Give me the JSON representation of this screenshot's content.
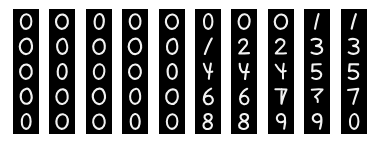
{
  "figure": {
    "name": "mnist-digit-sample-grid",
    "background_color": "#ffffff",
    "tile_background_color": "#000000",
    "digit_stroke_color": "#f2f2f2",
    "rows": 5,
    "columns": 10,
    "total_tiles": 50
  },
  "grid": {
    "rows": [
      {
        "row_index": 0,
        "cells": [
          {
            "label": "0"
          },
          {
            "label": "0"
          },
          {
            "label": "0"
          },
          {
            "label": "0"
          },
          {
            "label": "0"
          },
          {
            "label": "0"
          },
          {
            "label": "0"
          },
          {
            "label": "0"
          },
          {
            "label": "1"
          },
          {
            "label": "1"
          }
        ]
      },
      {
        "row_index": 1,
        "cells": [
          {
            "label": "0"
          },
          {
            "label": "0"
          },
          {
            "label": "0"
          },
          {
            "label": "0"
          },
          {
            "label": "0"
          },
          {
            "label": "1"
          },
          {
            "label": "2"
          },
          {
            "label": "2"
          },
          {
            "label": "3"
          },
          {
            "label": "3"
          }
        ]
      },
      {
        "row_index": 2,
        "cells": [
          {
            "label": "0"
          },
          {
            "label": "0"
          },
          {
            "label": "0"
          },
          {
            "label": "0"
          },
          {
            "label": "0"
          },
          {
            "label": "4"
          },
          {
            "label": "4"
          },
          {
            "label": "4"
          },
          {
            "label": "5"
          },
          {
            "label": "5"
          }
        ]
      },
      {
        "row_index": 3,
        "cells": [
          {
            "label": "0"
          },
          {
            "label": "0"
          },
          {
            "label": "0"
          },
          {
            "label": "0"
          },
          {
            "label": "0"
          },
          {
            "label": "6"
          },
          {
            "label": "6"
          },
          {
            "label": "7"
          },
          {
            "label": "7"
          },
          {
            "label": "7"
          }
        ]
      },
      {
        "row_index": 4,
        "cells": [
          {
            "label": "0"
          },
          {
            "label": "0"
          },
          {
            "label": "0"
          },
          {
            "label": "0"
          },
          {
            "label": "0"
          },
          {
            "label": "8"
          },
          {
            "label": "8"
          },
          {
            "label": "9"
          },
          {
            "label": "9"
          },
          {
            "label": "0"
          }
        ]
      }
    ]
  },
  "chart_data": {
    "type": "heatmap",
    "title": "",
    "xlabel": "",
    "ylabel": "",
    "grid": [
      [
        "0",
        "0",
        "0",
        "0",
        "0",
        "0",
        "0",
        "0",
        "1",
        "1"
      ],
      [
        "0",
        "0",
        "0",
        "0",
        "0",
        "1",
        "2",
        "2",
        "3",
        "3"
      ],
      [
        "0",
        "0",
        "0",
        "0",
        "0",
        "4",
        "4",
        "4",
        "5",
        "5"
      ],
      [
        "0",
        "0",
        "0",
        "0",
        "0",
        "6",
        "6",
        "7",
        "7",
        "7"
      ],
      [
        "0",
        "0",
        "0",
        "0",
        "0",
        "8",
        "8",
        "9",
        "9",
        "0"
      ]
    ]
  }
}
